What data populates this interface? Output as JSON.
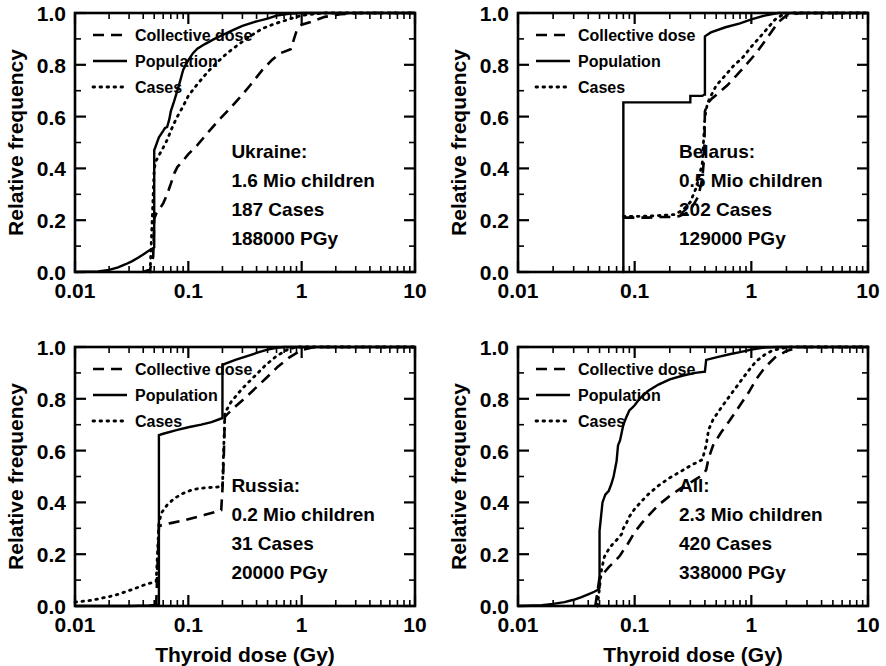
{
  "figure": {
    "type": "multi-panel-line-chart",
    "panels_layout": "2x2",
    "xlabel": "Thyroid dose (Gy)",
    "ylabel": "Relative frequency"
  },
  "axes": {
    "x_ticklabels": [
      "0.01",
      "0.1",
      "1",
      "10"
    ],
    "x_tickvalues": [
      0.01,
      0.1,
      1,
      10
    ],
    "x_scale": "log",
    "xlim": [
      0.01,
      10
    ],
    "y_ticklabels": [
      "0.0",
      "0.2",
      "0.4",
      "0.6",
      "0.8",
      "1.0"
    ],
    "y_tickvalues": [
      0.0,
      0.2,
      0.4,
      0.6,
      0.8,
      1.0
    ],
    "y_scale": "linear",
    "ylim": [
      0,
      1
    ]
  },
  "legend": {
    "position": "upper-left",
    "entries": [
      {
        "label": "Collective dose",
        "style": "dashed"
      },
      {
        "label": "Population",
        "style": "solid"
      },
      {
        "label": "Cases",
        "style": "dotted"
      }
    ]
  },
  "chart_data": [
    {
      "type": "line",
      "panel": "top-left",
      "title": "Ukraine:",
      "annotation": [
        "Ukraine:",
        "1.6 Mio children",
        "187 Cases",
        "188000 PGy"
      ],
      "region": "Ukraine",
      "children_mio": 1.6,
      "cases": 187,
      "collective_dose_pgy": 188000,
      "xlabel": "Thyroid dose (Gy)",
      "ylabel": "Relative frequency",
      "xlim": [
        0.01,
        10
      ],
      "ylim": [
        0,
        1
      ],
      "grid": false,
      "series": [
        {
          "name": "Population",
          "style": "solid",
          "x": [
            0.01,
            0.016,
            0.02,
            0.024,
            0.028,
            0.032,
            0.036,
            0.04,
            0.044,
            0.048,
            0.049,
            0.05,
            0.05,
            0.055,
            0.06,
            0.062,
            0.065,
            0.068,
            0.07,
            0.075,
            0.08,
            0.085,
            0.09,
            0.095,
            0.1,
            0.11,
            0.12,
            0.14,
            0.17,
            0.2,
            0.25,
            0.3,
            0.4,
            0.5,
            0.6,
            0.8,
            1.0,
            2.0,
            10.0
          ],
          "y": [
            0.0,
            0.002,
            0.008,
            0.018,
            0.03,
            0.042,
            0.055,
            0.068,
            0.08,
            0.09,
            0.092,
            0.095,
            0.47,
            0.52,
            0.545,
            0.555,
            0.56,
            0.59,
            0.62,
            0.66,
            0.7,
            0.74,
            0.78,
            0.8,
            0.818,
            0.845,
            0.862,
            0.88,
            0.9,
            0.915,
            0.935,
            0.95,
            0.968,
            0.978,
            0.99,
            0.998,
            1.0,
            1.0,
            1.0
          ]
        },
        {
          "name": "Cases",
          "style": "dotted",
          "x": [
            0.046,
            0.05,
            0.052,
            0.055,
            0.06,
            0.065,
            0.07,
            0.075,
            0.08,
            0.09,
            0.1,
            0.12,
            0.15,
            0.18,
            0.22,
            0.28,
            0.35,
            0.45,
            0.55,
            0.7,
            0.9,
            1.0,
            1.2,
            1.6,
            2.0,
            3.0,
            10.0
          ],
          "y": [
            0.0,
            0.4,
            0.43,
            0.45,
            0.48,
            0.51,
            0.545,
            0.575,
            0.6,
            0.64,
            0.68,
            0.725,
            0.775,
            0.81,
            0.845,
            0.88,
            0.91,
            0.94,
            0.955,
            0.97,
            0.985,
            0.99,
            0.995,
            1.0,
            1.0,
            1.0,
            1.0
          ]
        },
        {
          "name": "Collective dose",
          "style": "dashed",
          "x": [
            0.04,
            0.046,
            0.049,
            0.05,
            0.052,
            0.055,
            0.06,
            0.065,
            0.07,
            0.075,
            0.08,
            0.09,
            0.1,
            0.12,
            0.15,
            0.18,
            0.22,
            0.28,
            0.35,
            0.45,
            0.55,
            0.65,
            0.8,
            0.9,
            1.0,
            1.2,
            1.6,
            2.2,
            3.0,
            10.0
          ],
          "y": [
            0.0,
            0.01,
            0.06,
            0.205,
            0.225,
            0.24,
            0.265,
            0.3,
            0.34,
            0.38,
            0.405,
            0.43,
            0.455,
            0.49,
            0.54,
            0.58,
            0.62,
            0.67,
            0.72,
            0.78,
            0.82,
            0.845,
            0.86,
            0.93,
            0.955,
            0.965,
            0.985,
            0.995,
            1.0,
            1.0
          ]
        }
      ]
    },
    {
      "type": "line",
      "panel": "top-right",
      "title": "Belarus:",
      "annotation": [
        "Belarus:",
        "0.5 Mio children",
        "202 Cases",
        "129000 PGy"
      ],
      "region": "Belarus",
      "children_mio": 0.5,
      "cases": 202,
      "collective_dose_pgy": 129000,
      "xlabel": "Thyroid dose (Gy)",
      "ylabel": "Relative frequency",
      "xlim": [
        0.01,
        10
      ],
      "ylim": [
        0,
        1
      ],
      "grid": false,
      "series": [
        {
          "name": "Population",
          "style": "solid",
          "x": [
            0.079,
            0.08,
            0.08,
            0.2,
            0.29,
            0.3,
            0.3,
            0.38,
            0.395,
            0.4,
            0.4,
            0.45,
            0.6,
            0.8,
            1.0,
            1.3,
            1.6,
            1.7,
            2.0,
            3.0,
            10.0
          ],
          "y": [
            0.0,
            0.0,
            0.655,
            0.655,
            0.655,
            0.655,
            0.68,
            0.68,
            0.685,
            0.685,
            0.91,
            0.925,
            0.945,
            0.96,
            0.975,
            0.99,
            0.998,
            1.0,
            1.0,
            1.0,
            1.0
          ]
        },
        {
          "name": "Cases",
          "style": "dotted",
          "x": [
            0.08,
            0.09,
            0.11,
            0.13,
            0.16,
            0.19,
            0.22,
            0.26,
            0.3,
            0.34,
            0.38,
            0.4,
            0.42,
            0.45,
            0.5,
            0.6,
            0.7,
            0.85,
            1.0,
            1.2,
            1.4,
            1.6,
            1.8,
            2.2,
            3.0,
            10.0
          ],
          "y": [
            0.215,
            0.215,
            0.215,
            0.216,
            0.218,
            0.22,
            0.222,
            0.24,
            0.27,
            0.33,
            0.42,
            0.6,
            0.65,
            0.68,
            0.72,
            0.76,
            0.795,
            0.83,
            0.87,
            0.91,
            0.945,
            0.975,
            0.99,
            1.0,
            1.0,
            1.0
          ]
        },
        {
          "name": "Collective dose",
          "style": "dashed",
          "x": [
            0.08,
            0.1,
            0.13,
            0.16,
            0.2,
            0.24,
            0.28,
            0.31,
            0.35,
            0.38,
            0.395,
            0.4,
            0.42,
            0.46,
            0.52,
            0.62,
            0.75,
            0.9,
            1.1,
            1.3,
            1.5,
            1.7,
            2.0,
            2.6,
            10.0
          ],
          "y": [
            0.21,
            0.21,
            0.21,
            0.212,
            0.213,
            0.215,
            0.228,
            0.25,
            0.29,
            0.36,
            0.45,
            0.62,
            0.65,
            0.67,
            0.69,
            0.72,
            0.76,
            0.8,
            0.845,
            0.89,
            0.93,
            0.965,
            0.99,
            1.0,
            1.0
          ]
        }
      ]
    },
    {
      "type": "line",
      "panel": "bottom-left",
      "title": "Russia:",
      "annotation": [
        "Russia:",
        "0.2 Mio children",
        "31 Cases",
        "20000 PGy"
      ],
      "region": "Russia",
      "children_mio": 0.2,
      "cases": 31,
      "collective_dose_pgy": 20000,
      "xlabel": "Thyroid dose (Gy)",
      "ylabel": "Relative frequency",
      "xlim": [
        0.01,
        10
      ],
      "ylim": [
        0,
        1
      ],
      "grid": false,
      "series": [
        {
          "name": "Population",
          "style": "solid",
          "x": [
            0.01,
            0.03,
            0.045,
            0.052,
            0.055,
            0.055,
            0.06,
            0.08,
            0.1,
            0.13,
            0.16,
            0.19,
            0.2,
            0.2,
            0.21,
            0.26,
            0.33,
            0.42,
            0.5,
            0.6,
            0.7,
            0.9,
            1.2,
            2.0,
            10.0
          ],
          "y": [
            0.0,
            0.0,
            0.002,
            0.004,
            0.006,
            0.66,
            0.665,
            0.68,
            0.69,
            0.7,
            0.71,
            0.722,
            0.725,
            0.93,
            0.935,
            0.95,
            0.965,
            0.98,
            0.99,
            0.997,
            1.0,
            1.0,
            1.0,
            1.0,
            1.0
          ]
        },
        {
          "name": "Cases",
          "style": "dotted",
          "x": [
            0.01,
            0.014,
            0.018,
            0.022,
            0.028,
            0.034,
            0.04,
            0.046,
            0.052,
            0.055,
            0.058,
            0.065,
            0.075,
            0.09,
            0.11,
            0.13,
            0.16,
            0.19,
            0.2,
            0.21,
            0.24,
            0.3,
            0.38,
            0.48,
            0.6,
            0.75,
            0.9,
            1.2,
            10.0
          ],
          "y": [
            0.015,
            0.022,
            0.032,
            0.04,
            0.055,
            0.068,
            0.08,
            0.088,
            0.095,
            0.32,
            0.36,
            0.39,
            0.415,
            0.435,
            0.45,
            0.455,
            0.458,
            0.46,
            0.46,
            0.745,
            0.79,
            0.84,
            0.885,
            0.93,
            0.965,
            0.99,
            1.0,
            1.0,
            1.0
          ]
        },
        {
          "name": "Collective dose",
          "style": "dashed",
          "x": [
            0.052,
            0.055,
            0.058,
            0.07,
            0.09,
            0.11,
            0.14,
            0.17,
            0.195,
            0.2,
            0.205,
            0.21,
            0.22,
            0.26,
            0.32,
            0.4,
            0.5,
            0.62,
            0.78,
            1.0,
            1.3,
            2.0,
            10.0
          ],
          "y": [
            0.0,
            0.308,
            0.312,
            0.32,
            0.33,
            0.34,
            0.352,
            0.362,
            0.37,
            0.45,
            0.56,
            0.73,
            0.74,
            0.77,
            0.805,
            0.845,
            0.885,
            0.925,
            0.96,
            0.988,
            1.0,
            1.0,
            1.0
          ]
        }
      ]
    },
    {
      "type": "line",
      "panel": "bottom-right",
      "title": "All:",
      "annotation": [
        "All:",
        "2.3 Mio children",
        "420 Cases",
        "338000 PGy"
      ],
      "region": "All",
      "children_mio": 2.3,
      "cases": 420,
      "collective_dose_pgy": 338000,
      "xlabel": "Thyroid dose (Gy)",
      "ylabel": "Relative frequency",
      "xlim": [
        0.01,
        10
      ],
      "ylim": [
        0,
        1
      ],
      "grid": false,
      "series": [
        {
          "name": "Population",
          "style": "solid",
          "x": [
            0.01,
            0.016,
            0.02,
            0.025,
            0.03,
            0.035,
            0.04,
            0.045,
            0.048,
            0.05,
            0.05,
            0.053,
            0.056,
            0.06,
            0.063,
            0.066,
            0.07,
            0.072,
            0.075,
            0.08,
            0.085,
            0.09,
            0.095,
            0.1,
            0.11,
            0.13,
            0.16,
            0.2,
            0.26,
            0.33,
            0.4,
            0.41,
            0.5,
            0.65,
            0.8,
            1.0,
            1.3,
            1.7,
            2.2,
            10.0
          ],
          "y": [
            0.0,
            0.003,
            0.008,
            0.015,
            0.024,
            0.034,
            0.045,
            0.055,
            0.062,
            0.07,
            0.29,
            0.4,
            0.43,
            0.445,
            0.47,
            0.5,
            0.56,
            0.62,
            0.64,
            0.7,
            0.73,
            0.755,
            0.765,
            0.775,
            0.8,
            0.83,
            0.855,
            0.875,
            0.89,
            0.9,
            0.905,
            0.95,
            0.96,
            0.972,
            0.98,
            0.99,
            0.998,
            1.0,
            1.0,
            1.0
          ]
        },
        {
          "name": "Cases",
          "style": "dotted",
          "x": [
            0.048,
            0.052,
            0.055,
            0.06,
            0.065,
            0.07,
            0.075,
            0.078,
            0.08,
            0.085,
            0.09,
            0.1,
            0.115,
            0.13,
            0.16,
            0.2,
            0.25,
            0.31,
            0.38,
            0.41,
            0.43,
            0.47,
            0.55,
            0.65,
            0.8,
            0.95,
            1.1,
            1.3,
            1.5,
            1.8,
            2.2,
            3.0,
            10.0
          ],
          "y": [
            0.0,
            0.14,
            0.19,
            0.22,
            0.24,
            0.255,
            0.27,
            0.28,
            0.3,
            0.32,
            0.345,
            0.375,
            0.405,
            0.43,
            0.465,
            0.495,
            0.52,
            0.545,
            0.565,
            0.62,
            0.68,
            0.72,
            0.765,
            0.81,
            0.865,
            0.91,
            0.945,
            0.97,
            0.985,
            0.995,
            1.0,
            1.0,
            1.0
          ]
        },
        {
          "name": "Collective dose",
          "style": "dashed",
          "x": [
            0.046,
            0.05,
            0.055,
            0.06,
            0.065,
            0.07,
            0.075,
            0.08,
            0.085,
            0.09,
            0.1,
            0.115,
            0.135,
            0.16,
            0.2,
            0.25,
            0.31,
            0.38,
            0.41,
            0.43,
            0.47,
            0.55,
            0.65,
            0.8,
            0.95,
            1.1,
            1.3,
            1.6,
            2.0,
            2.6,
            10.0
          ],
          "y": [
            0.0,
            0.11,
            0.13,
            0.15,
            0.165,
            0.18,
            0.195,
            0.215,
            0.23,
            0.25,
            0.285,
            0.32,
            0.355,
            0.39,
            0.425,
            0.455,
            0.48,
            0.505,
            0.525,
            0.57,
            0.62,
            0.67,
            0.715,
            0.775,
            0.825,
            0.875,
            0.92,
            0.96,
            0.985,
            1.0,
            1.0
          ]
        }
      ]
    }
  ]
}
